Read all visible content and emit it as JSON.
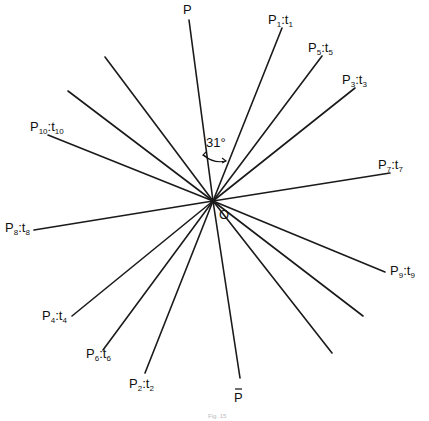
{
  "figure": {
    "caption": "Fig. 15",
    "origin_label": "O",
    "angle_annotation": "31°",
    "rays": [
      {
        "id": "P",
        "label": "P",
        "sub": "",
        "label2": "",
        "sub2": "",
        "bar": false
      },
      {
        "id": "P1",
        "label": "P",
        "sub": "1",
        "label2": "t",
        "sub2": "1",
        "bar": false
      },
      {
        "id": "P5",
        "label": "P",
        "sub": "5",
        "label2": "t",
        "sub2": "5",
        "bar": false
      },
      {
        "id": "P3",
        "label": "P",
        "sub": "3",
        "label2": "t",
        "sub2": "3",
        "bar": false
      },
      {
        "id": "P7",
        "label": "P",
        "sub": "7",
        "label2": "t",
        "sub2": "7",
        "bar": false
      },
      {
        "id": "P10",
        "label": "P",
        "sub": "10",
        "label2": "t",
        "sub2": "10",
        "bar": false
      },
      {
        "id": "U1",
        "label": "",
        "sub": "",
        "label2": "",
        "sub2": "",
        "bar": false
      },
      {
        "id": "U2",
        "label": "",
        "sub": "",
        "label2": "",
        "sub2": "",
        "bar": false
      },
      {
        "id": "P8",
        "label": "P",
        "sub": "8",
        "label2": "t",
        "sub2": "8",
        "bar": false
      },
      {
        "id": "P4",
        "label": "P",
        "sub": "4",
        "label2": "t",
        "sub2": "4",
        "bar": false
      },
      {
        "id": "P6",
        "label": "P",
        "sub": "6",
        "label2": "t",
        "sub2": "6",
        "bar": false
      },
      {
        "id": "P2",
        "label": "P",
        "sub": "2",
        "label2": "t",
        "sub2": "2",
        "bar": false
      },
      {
        "id": "Pbar",
        "label": "P",
        "sub": "",
        "label2": "",
        "sub2": "",
        "bar": true
      },
      {
        "id": "P9",
        "label": "P",
        "sub": "9",
        "label2": "t",
        "sub2": "9",
        "bar": false
      },
      {
        "id": "U3",
        "label": "",
        "sub": "",
        "label2": "",
        "sub2": "",
        "bar": false
      },
      {
        "id": "U4",
        "label": "",
        "sub": "",
        "label2": "",
        "sub2": "",
        "bar": false
      }
    ]
  }
}
